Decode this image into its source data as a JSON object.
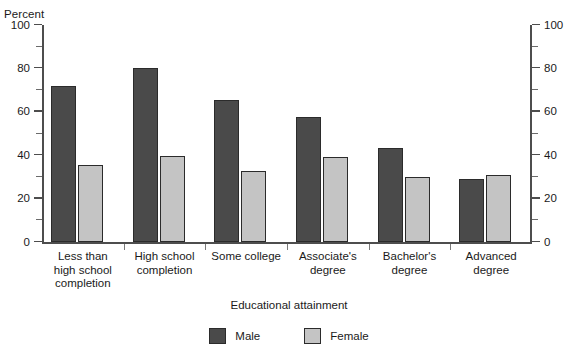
{
  "chart_data": {
    "type": "bar",
    "title": "",
    "xlabel": "Educational attainment",
    "ylabel": "Percent",
    "ylim": [
      0,
      100
    ],
    "ytick_step": 20,
    "yminor_step": 10,
    "grid": false,
    "legend_position": "bottom",
    "categories": [
      "Less than\nhigh school\ncompletion",
      "High school\ncompletion",
      "Some college",
      "Associate's\ndegree",
      "Bachelor's\ndegree",
      "Advanced\ndegree"
    ],
    "ytick_labels": [
      "0",
      "20",
      "40",
      "60",
      "80",
      "100"
    ],
    "ytick_values": [
      0,
      20,
      40,
      60,
      80,
      100
    ],
    "series": [
      {
        "name": "Male",
        "color": "#4a4a4a",
        "values": [
          72,
          80,
          65.5,
          57.5,
          43.5,
          29
        ]
      },
      {
        "name": "Female",
        "color": "#c4c4c4",
        "values": [
          35.5,
          39.5,
          32.5,
          39,
          30,
          31
        ]
      }
    ]
  },
  "axes": {
    "left_unit_label": "Percent",
    "right_tick_labels": [
      "0",
      "20",
      "40",
      "60",
      "80",
      "100"
    ],
    "x_axis_title": "Educational attainment"
  },
  "legend": {
    "items": [
      {
        "label": "Male",
        "color": "#4a4a4a"
      },
      {
        "label": "Female",
        "color": "#c4c4c4"
      }
    ]
  },
  "cropped_header": {
    "text": ""
  }
}
